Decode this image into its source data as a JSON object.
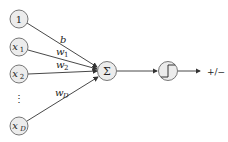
{
  "diagram": {
    "type": "perceptron",
    "inputs": [
      {
        "label": "1",
        "sub": ""
      },
      {
        "label": "x",
        "sub": "1"
      },
      {
        "label": "x",
        "sub": "2"
      },
      {
        "label": "x",
        "sub": "D"
      }
    ],
    "ellipsis": "⋮",
    "weights": [
      {
        "label": "b",
        "sub": ""
      },
      {
        "label": "w",
        "sub": "1"
      },
      {
        "label": "w",
        "sub": "2"
      },
      {
        "label": "w",
        "sub": "D"
      }
    ],
    "sum_node": "Σ",
    "activation_node": "step-function",
    "output_label": "+/−",
    "colors": {
      "node_fill": "#ececec",
      "stroke": "#333333"
    }
  }
}
